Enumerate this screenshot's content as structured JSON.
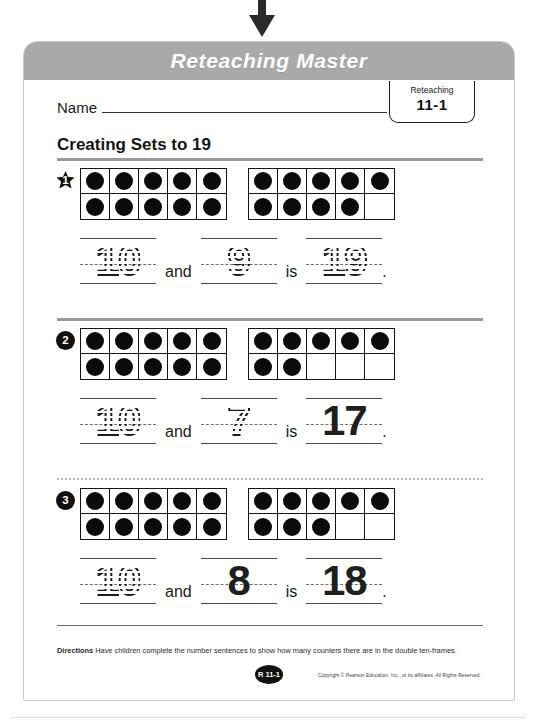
{
  "banner": {
    "title": "Reteaching Master"
  },
  "name_field": {
    "label": "Name",
    "value": ""
  },
  "tab_badge": {
    "kind": "Reteaching",
    "number": "11-1"
  },
  "lesson": {
    "title": "Creating Sets to 19"
  },
  "frames": {
    "columns": 5,
    "rows": 2
  },
  "exercises": [
    {
      "number": "1",
      "marker_shape": "star",
      "left_frame": {
        "top": 5,
        "bottom": 5
      },
      "right_frame": {
        "top": 5,
        "bottom": 4
      },
      "addend1": {
        "text": "10",
        "style": "traced"
      },
      "conj": "and",
      "addend2": {
        "text": "9",
        "style": "traced"
      },
      "verb": "is",
      "sum": {
        "text": "19",
        "style": "traced"
      },
      "period": "."
    },
    {
      "number": "2",
      "marker_shape": "circle",
      "left_frame": {
        "top": 5,
        "bottom": 5
      },
      "right_frame": {
        "top": 5,
        "bottom": 2
      },
      "addend1": {
        "text": "10",
        "style": "traced"
      },
      "conj": "and",
      "addend2": {
        "text": "7",
        "style": "traced"
      },
      "verb": "is",
      "sum": {
        "text": "17",
        "style": "solid"
      },
      "period": "."
    },
    {
      "number": "3",
      "marker_shape": "circle",
      "left_frame": {
        "top": 5,
        "bottom": 5
      },
      "right_frame": {
        "top": 5,
        "bottom": 3
      },
      "addend1": {
        "text": "10",
        "style": "traced"
      },
      "conj": "and",
      "addend2": {
        "text": "8",
        "style": "solid"
      },
      "verb": "is",
      "sum": {
        "text": "18",
        "style": "solid"
      },
      "period": "."
    }
  ],
  "footer": {
    "directions_label": "Directions",
    "directions_text": "Have children complete the number sentences to show how many counters there are in the double ten-frames.",
    "page_code": "R 11-1",
    "copyright": "Copyright © Pearson Education, Inc., or its affiliates. All Rights Reserved."
  },
  "colors": {
    "banner_bg": "#a9a9a9",
    "ink": "#111111",
    "rule": "#9a9a9a"
  }
}
